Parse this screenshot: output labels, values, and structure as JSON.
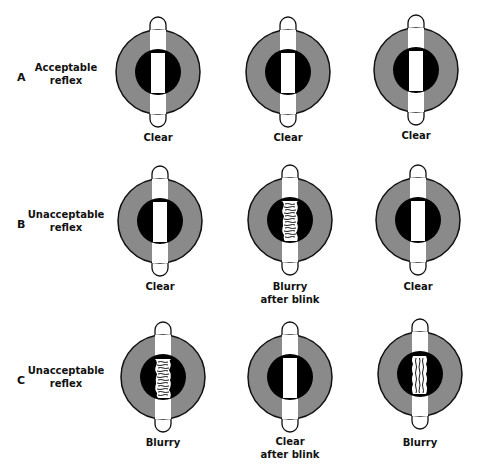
{
  "figure": {
    "colors": {
      "iris": "#8a8a8a",
      "pupil": "#000000",
      "reflex": "#ffffff",
      "outline": "#111111"
    },
    "rows": [
      {
        "letter": "A",
        "description": [
          "Acceptable",
          "reflex"
        ],
        "eyes": [
          {
            "state": "clear",
            "caption": [
              "Clear"
            ]
          },
          {
            "state": "clear",
            "caption": [
              "Clear"
            ]
          },
          {
            "state": "clear",
            "caption": [
              "Clear"
            ]
          }
        ]
      },
      {
        "letter": "B",
        "description": [
          "Unacceptable",
          "reflex"
        ],
        "eyes": [
          {
            "state": "clear",
            "caption": [
              "Clear"
            ]
          },
          {
            "state": "blurry",
            "caption": [
              "Blurry",
              "after blink"
            ]
          },
          {
            "state": "clear",
            "caption": [
              "Clear"
            ]
          }
        ]
      },
      {
        "letter": "C",
        "description": [
          "Unacceptable",
          "reflex"
        ],
        "eyes": [
          {
            "state": "blurry",
            "caption": [
              "Blurry"
            ]
          },
          {
            "state": "clear",
            "caption": [
              "Clear",
              "after blink"
            ]
          },
          {
            "state": "blurry",
            "caption": [
              "Blurry"
            ]
          }
        ]
      }
    ]
  }
}
